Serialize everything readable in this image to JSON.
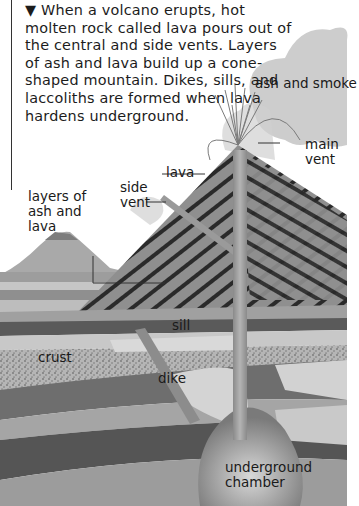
{
  "intro": {
    "bullet": "▼",
    "text": "When a volcano erupts, hot molten rock called lava pours out of the central and side vents. Layers of ash and lava build up a cone-shaped mountain. Dikes, sills, and laccoliths are formed when lava hardens underground."
  },
  "labels": {
    "ash_and_smoke": "ash and smoke",
    "main_vent": "main vent",
    "lava": "lava",
    "side_vent": "side vent",
    "layers_of_ash_and_lava": "layers of ash and lava",
    "sill": "sill",
    "crust": "crust",
    "dike": "dike",
    "underground_chamber": "underground chamber"
  },
  "colors": {
    "background": "#ffffff",
    "text": "#1a1a1a",
    "cone_stripe_dark": "#2b2b2b",
    "cone_stripe_light": "#8a8a8a",
    "crust_light": "#c8c8c8",
    "crust_dark": "#5a5a5a",
    "smoke": "#bdbdbd"
  }
}
